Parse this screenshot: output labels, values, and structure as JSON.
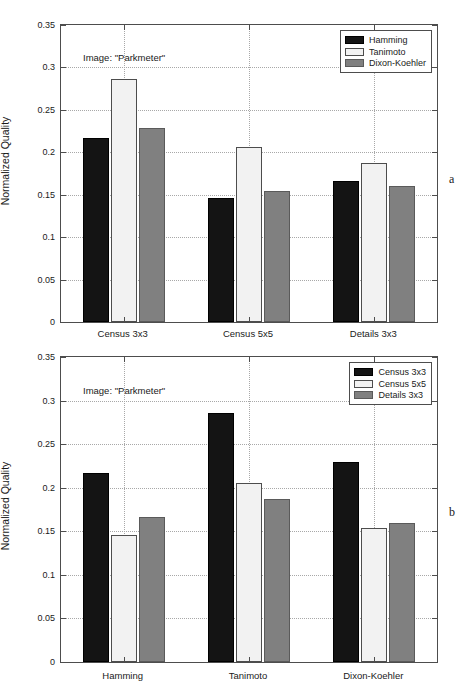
{
  "figure": {
    "panels": [
      {
        "letter": "a",
        "annotation": "Image: \"Parkmeter\"",
        "chart_data": {
          "type": "bar",
          "title": "",
          "xlabel": "",
          "ylabel": "Normalized Quality",
          "ylim": [
            0,
            0.35
          ],
          "yticks": [
            "0",
            "0.05",
            "0.1",
            "0.15",
            "0.2",
            "0.25",
            "0.3",
            "0.35"
          ],
          "ytick_values": [
            0,
            0.05,
            0.1,
            0.15,
            0.2,
            0.25,
            0.3,
            0.35
          ],
          "grid": true,
          "legend_position": "top-right",
          "categories": [
            "Census 3x3",
            "Census 5x5",
            "Details 3x3"
          ],
          "series": [
            {
              "name": "Hamming",
              "color": "#141414",
              "values": [
                0.217,
                0.146,
                0.166
              ]
            },
            {
              "name": "Tanimoto",
              "color": "#f2f2f2",
              "values": [
                0.286,
                0.206,
                0.187
              ]
            },
            {
              "name": "Dixon-Koehler",
              "color": "#808080",
              "values": [
                0.229,
                0.154,
                0.16
              ]
            }
          ]
        }
      },
      {
        "letter": "b",
        "annotation": "Image: \"Parkmeter\"",
        "chart_data": {
          "type": "bar",
          "title": "",
          "xlabel": "",
          "ylabel": "Normalized Quality",
          "ylim": [
            0,
            0.35
          ],
          "yticks": [
            "0",
            "0.05",
            "0.1",
            "0.15",
            "0.2",
            "0.25",
            "0.3",
            "0.35"
          ],
          "ytick_values": [
            0,
            0.05,
            0.1,
            0.15,
            0.2,
            0.25,
            0.3,
            0.35
          ],
          "grid": true,
          "legend_position": "top-right",
          "categories": [
            "Hamming",
            "Tanimoto",
            "Dixon-Koehler"
          ],
          "series": [
            {
              "name": "Census 3x3",
              "color": "#141414",
              "values": [
                0.217,
                0.286,
                0.229
              ]
            },
            {
              "name": "Census 5x5",
              "color": "#f2f2f2",
              "values": [
                0.146,
                0.206,
                0.154
              ]
            },
            {
              "name": "Details 3x3",
              "color": "#808080",
              "values": [
                0.166,
                0.187,
                0.16
              ]
            }
          ]
        }
      }
    ]
  }
}
